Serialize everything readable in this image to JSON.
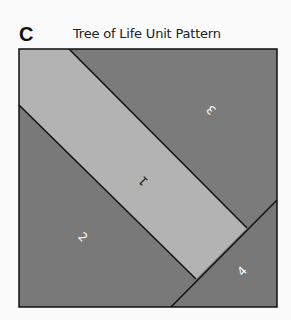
{
  "figure": {
    "letter": "C",
    "title": "Tree of Life Unit Pattern"
  },
  "pattern": {
    "colors": {
      "light": "#b3b3b3",
      "dark": "#7a7a7a",
      "line": "#111111",
      "label_light": "#ffffff",
      "label_dark": "#111111"
    },
    "pieces": [
      {
        "id": "1",
        "label": "1",
        "shade": "light"
      },
      {
        "id": "2",
        "label": "2",
        "shade": "dark"
      },
      {
        "id": "3",
        "label": "3",
        "shade": "dark"
      },
      {
        "id": "4",
        "label": "4",
        "shade": "dark"
      }
    ]
  }
}
